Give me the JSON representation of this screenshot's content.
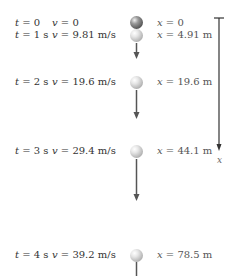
{
  "diagram": {
    "rows": [
      {
        "t_var": "t",
        "t_val": " = 0",
        "v_var": "v",
        "v_val": " = 0",
        "x_var": "x",
        "x_val": " = 0",
        "y": 17,
        "ball": "dark"
      },
      {
        "t_var": "t",
        "t_val": " = 1 s",
        "v_var": "v",
        "v_val": " = 9.81 m/s",
        "x_var": "x",
        "x_val": " = 4.91 m",
        "y": 29,
        "ball": "light"
      },
      {
        "t_var": "t",
        "t_val": " = 2 s",
        "v_var": "v",
        "v_val": " = 19.6 m/s",
        "x_var": "x",
        "x_val": " = 19.6 m",
        "y": 76,
        "ball": "light"
      },
      {
        "t_var": "t",
        "t_val": " = 3 s",
        "v_var": "v",
        "v_val": " = 29.4 m/s",
        "x_var": "x",
        "x_val": " = 44.1 m",
        "y": 145,
        "ball": "light"
      },
      {
        "t_var": "t",
        "t_val": " = 4 s",
        "v_var": "v",
        "v_val": " = 39.2 m/s",
        "x_var": "x",
        "x_val": " = 78.5 m",
        "y": 249,
        "ball": "light"
      }
    ],
    "velocity_arrows": [
      {
        "from_y": 42,
        "to_y": 58
      },
      {
        "from_y": 89,
        "to_y": 118
      },
      {
        "from_y": 158,
        "to_y": 200
      },
      {
        "from_y": 262,
        "to_y": 285
      }
    ],
    "axis": {
      "label": "x",
      "top_y": 18,
      "bottom_y": 150,
      "x": 219
    },
    "colors": {
      "arrow": "#555555",
      "axis": "#333333"
    }
  }
}
